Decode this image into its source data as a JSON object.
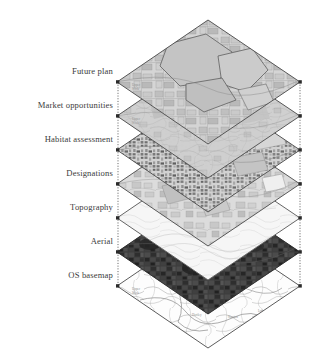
{
  "figure": {
    "background_color": "#ffffff",
    "label_color": "#3b3b3b",
    "outline_color": "#4a4a4a",
    "connector_color": "#555555",
    "vertex_marker_color": "#2b2b2b"
  },
  "layers": [
    {
      "id": "future-plan",
      "label": "Future plan",
      "order": 1,
      "label_y": 71,
      "vertex_y": 82,
      "fill": "#cfcfcf",
      "fill_opacity": 0.55,
      "texture": "plan-polygons",
      "note": "map with outlined development parcels, mid grey tone"
    },
    {
      "id": "market-opportunities",
      "label": "Market opportunities",
      "order": 2,
      "label_y": 105,
      "vertex_y": 116,
      "fill": "#c6c6c6",
      "fill_opacity": 0.5,
      "texture": "flat-wash",
      "note": "light grey wash with faint road network"
    },
    {
      "id": "habitat-assessment",
      "label": "Habitat assessment",
      "order": 3,
      "label_y": 139,
      "vertex_y": 150,
      "fill": "#bdbdbd",
      "fill_opacity": 0.62,
      "texture": "fine-mottle",
      "note": "dense speckled habitat parcels, darkest hatching on left half"
    },
    {
      "id": "designations",
      "label": "Designations",
      "order": 4,
      "label_y": 173,
      "vertex_y": 184,
      "fill": "#c9c9c9",
      "fill_opacity": 0.5,
      "texture": "designation-patches",
      "note": "pale grey with one solid black designated block right of centre"
    },
    {
      "id": "topography",
      "label": "Topography",
      "order": 5,
      "label_y": 207,
      "vertex_y": 218,
      "fill": "#f4f4f4",
      "fill_opacity": 0.9,
      "texture": "contours",
      "note": "near white with faint contour lines"
    },
    {
      "id": "aerial",
      "label": "Aerial",
      "order": 6,
      "label_y": 241,
      "vertex_y": 252,
      "fill": "#3a3a3a",
      "fill_opacity": 1,
      "texture": "aerial-photo",
      "note": "dark aerial photography, field mosaic texture"
    },
    {
      "id": "os-basemap",
      "label": "OS basemap",
      "order": 7,
      "label_y": 275,
      "vertex_y": 286,
      "fill": "#fbfbfb",
      "fill_opacity": 1,
      "texture": "line-basemap",
      "note": "white ordnance survey style linework with place names"
    }
  ],
  "geometry": {
    "left_vertex_x": 117,
    "right_vertex_x": 300,
    "center_x": 208,
    "half_height": 62,
    "layer_spacing": 34,
    "first_vertex_y": 82
  },
  "connectors": {
    "left_x": 118,
    "right_x": 300,
    "top_y": 82,
    "bottom_y": 286,
    "style": "dotted",
    "marker": "square-dot"
  }
}
